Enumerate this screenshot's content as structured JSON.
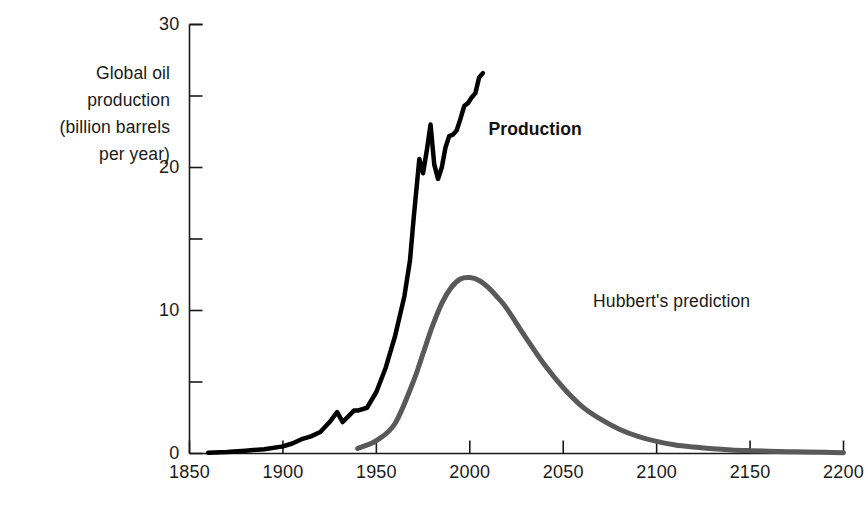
{
  "chart_data": {
    "type": "line",
    "title": "",
    "xlabel": "",
    "ylabel": "Global oil production\n(billion barrels\nper year)",
    "xlim": [
      1850,
      2200
    ],
    "ylim": [
      0,
      30
    ],
    "xticks": [
      1850,
      1900,
      1950,
      2000,
      2050,
      2100,
      2150,
      2200
    ],
    "xtick_labels": [
      "1850",
      "1900",
      "1950",
      "2000",
      "2050",
      "2100",
      "2150",
      "2200"
    ],
    "yticks": [
      0,
      10,
      20,
      30
    ],
    "ytick_labels": [
      "0",
      "10",
      "20",
      "30"
    ],
    "yticks_minor": [
      5,
      15,
      25
    ],
    "grid": false,
    "legend_position": "inline-annotations",
    "series": [
      {
        "name": "Production",
        "color": "#000000",
        "linewidth": 4.5,
        "label_text": "Production",
        "label_bold": true,
        "label_x": 2010,
        "label_y": 22.6,
        "x": [
          1860,
          1870,
          1880,
          1890,
          1900,
          1905,
          1910,
          1915,
          1920,
          1925,
          1929,
          1932,
          1935,
          1938,
          1940,
          1945,
          1950,
          1955,
          1960,
          1965,
          1968,
          1970,
          1973,
          1975,
          1977,
          1979,
          1981,
          1983,
          1985,
          1987,
          1989,
          1991,
          1993,
          1995,
          1997,
          1999,
          2001,
          2003,
          2005,
          2007
        ],
        "y": [
          0.05,
          0.1,
          0.2,
          0.3,
          0.5,
          0.7,
          1.0,
          1.2,
          1.5,
          2.2,
          2.9,
          2.2,
          2.6,
          3.0,
          3.0,
          3.2,
          4.3,
          6.0,
          8.2,
          11.0,
          13.5,
          16.5,
          20.6,
          19.6,
          21.2,
          23.0,
          20.2,
          19.2,
          20.0,
          21.4,
          22.2,
          22.3,
          22.6,
          23.4,
          24.3,
          24.5,
          24.9,
          25.2,
          26.3,
          26.6
        ]
      },
      {
        "name": "Hubbert's prediction",
        "color": "#595959",
        "linewidth": 5,
        "label_text": "Hubbert's prediction",
        "label_bold": false,
        "label_x": 2066,
        "label_y": 10.6,
        "peak_year": 2000,
        "peak_value": 12.3,
        "x": [
          1940,
          1950,
          1960,
          1970,
          1975,
          1980,
          1985,
          1990,
          1995,
          2000,
          2005,
          2010,
          2015,
          2020,
          2030,
          2040,
          2050,
          2060,
          2070,
          2080,
          2090,
          2100,
          2110,
          2120,
          2130,
          2140,
          2150,
          2160,
          2170,
          2180,
          2190,
          2200
        ],
        "y": [
          0.35,
          0.9,
          2.1,
          5.1,
          7.0,
          8.9,
          10.5,
          11.6,
          12.2,
          12.3,
          12.1,
          11.6,
          10.9,
          10.1,
          8.1,
          6.2,
          4.6,
          3.3,
          2.4,
          1.7,
          1.2,
          0.85,
          0.6,
          0.45,
          0.33,
          0.25,
          0.2,
          0.16,
          0.13,
          0.1,
          0.08,
          0.06
        ]
      }
    ]
  },
  "axis": {
    "frame_color": "#1a1a1a",
    "tick_color": "#1a1a1a"
  }
}
